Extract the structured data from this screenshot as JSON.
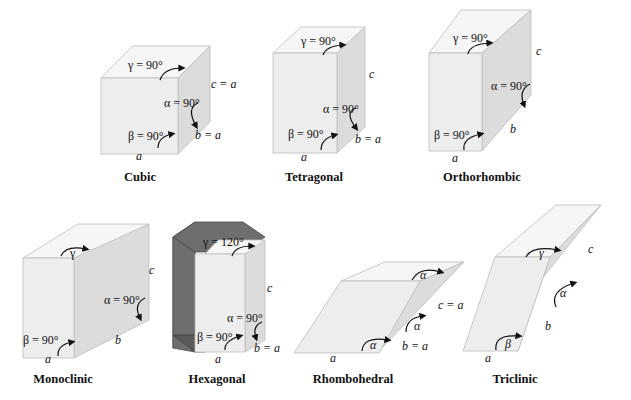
{
  "figure": {
    "systems": [
      {
        "name": "Cubic",
        "labels": {
          "gamma": "γ = 90°",
          "alpha": "α = 90°",
          "beta": "β = 90°",
          "a": "a",
          "b": "b = a",
          "c": "c = a"
        }
      },
      {
        "name": "Tetragonal",
        "labels": {
          "gamma": "γ = 90°",
          "alpha": "α = 90°",
          "beta": "β = 90°",
          "a": "a",
          "b": "b = a",
          "c": "c"
        }
      },
      {
        "name": "Orthorhombic",
        "labels": {
          "gamma": "γ = 90°",
          "alpha": "α = 90°",
          "beta": "β = 90°",
          "a": "a",
          "b": "b",
          "c": "c"
        }
      },
      {
        "name": "Monoclinic",
        "labels": {
          "gamma": "γ",
          "alpha": "α = 90°",
          "beta": "β = 90°",
          "a": "a",
          "b": "b",
          "c": "c"
        }
      },
      {
        "name": "Hexagonal",
        "labels": {
          "gamma": "γ = 120°",
          "alpha": "α = 90°",
          "beta": "β = 90°",
          "a": "a",
          "b": "b = a",
          "c": "c"
        }
      },
      {
        "name": "Rhombohedral",
        "labels": {
          "alpha_top": "α",
          "alpha_side": "α",
          "alpha_front": "α",
          "a": "a",
          "b": "b = a",
          "c": "c = a"
        }
      },
      {
        "name": "Triclinic",
        "labels": {
          "gamma": "γ",
          "alpha": "α",
          "beta": "β",
          "a": "a",
          "b": "b",
          "c": "c"
        }
      }
    ]
  }
}
